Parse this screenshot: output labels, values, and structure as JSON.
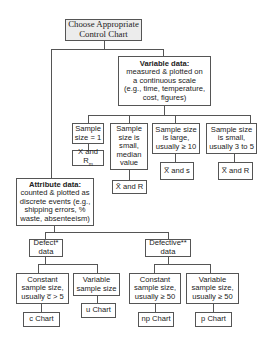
{
  "diagram": {
    "root": {
      "line1": "Choose Appropriate",
      "line2": "Control Chart"
    },
    "variable": {
      "title": "Variable data:",
      "lines": [
        "measured & plotted on",
        "a continuous scale",
        "(e.g., time, temperature,",
        "cost, figures)"
      ],
      "branches": [
        {
          "condition": [
            "Sample",
            "size = 1"
          ],
          "chart_main": "X and R",
          "chart_sub": "m"
        },
        {
          "condition": [
            "Sample",
            "size is",
            "small,",
            "median",
            "value"
          ],
          "chart_symbol": "X̃",
          "chart_rest": " and R"
        },
        {
          "condition": [
            "Sample size",
            "is large,",
            "usually ≥ 10"
          ],
          "chart_symbol": "X̅",
          "chart_rest": " and s"
        },
        {
          "condition": [
            "Sample size",
            "is small,",
            "usually 3 to 5"
          ],
          "chart_symbol": "X̅",
          "chart_rest": " and R"
        }
      ]
    },
    "attribute": {
      "title": "Attribute data:",
      "lines": [
        "counted & plotted as",
        "discrete events (e.g.,",
        "shipping errors, %",
        "waste, absenteeism)"
      ],
      "defect": {
        "label": [
          "Defect*",
          "data"
        ],
        "branches": [
          {
            "condition": [
              "Constant",
              "sample size,",
              "usually c̅ > 5"
            ],
            "chart": "c Chart"
          },
          {
            "condition": [
              "Variable",
              "sample size"
            ],
            "chart": "u Chart"
          }
        ]
      },
      "defective": {
        "label": [
          "Defective**",
          "data"
        ],
        "branches": [
          {
            "condition": [
              "Constant",
              "sample size,",
              "usually ≥ 50"
            ],
            "chart": "np Chart"
          },
          {
            "condition": [
              "Variable",
              "sample size,",
              "usually ≥ 50"
            ],
            "chart": "p Chart"
          }
        ]
      }
    }
  }
}
